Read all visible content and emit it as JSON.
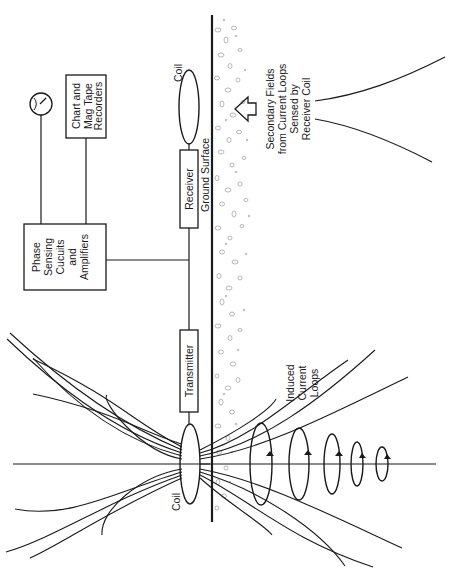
{
  "diagram": {
    "type": "electromagnetic induction survey schematic",
    "orientation": "rotated 90° counter-clockwise",
    "colors": {
      "ink": "#1a1a1a",
      "gravel": "#8a8a8a",
      "background": "#ffffff"
    },
    "labels": {
      "phase_box": [
        "Phase",
        "Sensing",
        "Cucuits",
        "and",
        "Amplifiers"
      ],
      "recorders_box": [
        "Chart and",
        "Mag Tape",
        "Recorders"
      ],
      "receiver_box": "Receiver",
      "transmitter_box": "Transmitter",
      "receiver_coil": "Coil",
      "transmitter_coil": "Coil",
      "ground_surface": "Ground Surface",
      "secondary_fields": [
        "Secondary Fields",
        "from Current Loops",
        "Sensed by",
        "Receiver Coil"
      ],
      "induced_loops": [
        "Induced",
        "Current",
        "Loops"
      ]
    },
    "components": [
      {
        "id": "meter-dial",
        "kind": "gauge icon"
      },
      {
        "id": "phase-sensing-box",
        "kind": "block"
      },
      {
        "id": "recorders-box",
        "kind": "block"
      },
      {
        "id": "receiver-box",
        "kind": "block"
      },
      {
        "id": "transmitter-box",
        "kind": "block"
      },
      {
        "id": "receiver-coil",
        "kind": "coil"
      },
      {
        "id": "transmitter-coil",
        "kind": "coil"
      },
      {
        "id": "ground-surface-line",
        "kind": "boundary"
      },
      {
        "id": "induced-current-loops",
        "kind": "loops",
        "count": 5
      },
      {
        "id": "secondary-field-arrow",
        "kind": "arrow"
      }
    ]
  }
}
